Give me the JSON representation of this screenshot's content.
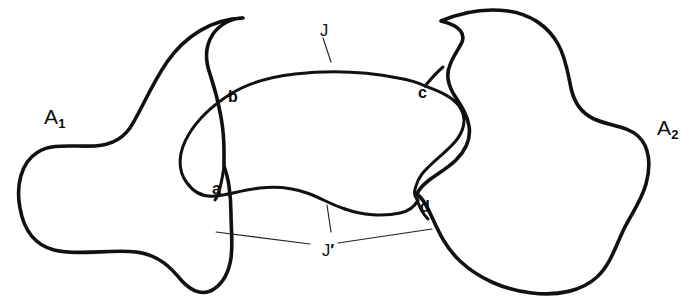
{
  "figure": {
    "background_color": "#ffffff",
    "stroke_color": "#111111",
    "width": 691,
    "height": 302
  },
  "regions": [
    {
      "id": "A1",
      "label": "A",
      "subscript": "1",
      "description": "left blob region",
      "label_x": 44,
      "label_y": 106
    },
    {
      "id": "A2",
      "label": "A",
      "subscript": "2",
      "description": "right blob region",
      "label_x": 657,
      "label_y": 117
    }
  ],
  "points": [
    {
      "id": "a",
      "label": "a",
      "x": 212,
      "y": 181,
      "description": "lower-left intersection point"
    },
    {
      "id": "b",
      "label": "b",
      "x": 228,
      "y": 89,
      "description": "upper-left intersection point"
    },
    {
      "id": "c",
      "label": "c",
      "x": 418,
      "y": 85,
      "description": "upper-right intersection point"
    },
    {
      "id": "d",
      "label": "d",
      "x": 420,
      "y": 199,
      "description": "lower-right intersection point"
    }
  ],
  "arcs": [
    {
      "id": "J",
      "label": "J",
      "prime": false,
      "description": "upper arc of the inner curve between b and c",
      "label_x": 320,
      "label_y": 22
    },
    {
      "id": "Jprime",
      "label": "J",
      "prime": true,
      "prime_glyph": "′",
      "description": "lower arc of the inner curve between a and d",
      "label_x": 322,
      "label_y": 242
    }
  ],
  "paths": {
    "blob_left": "M 243,18 C 212,19 185,36 167,62 C 152,84 143,106 133,123 C 125,138 111,145 95,146 C 72,147 52,143 38,152 C 20,163 16,187 20,208 C 24,231 35,245 54,250 C 78,256 110,249 136,252 C 160,255 172,269 182,281 C 192,292 204,296 214,289 C 223,283 229,271 231,258 C 233,243 231,228 231,214 C 231,203 230,193 229,186 C 228,178 226,172 224,166 L 224,152 C 224,140 223,128 221,117 C 218,100 214,86 210,74 C 205,60 205,46 213,34 C 220,24 232,18 243,18 Z",
    "blob_right": "M 441,21 C 462,12 486,8 508,11 C 530,14 548,26 558,44 C 566,58 568,74 571,88 C 574,102 581,113 594,119 C 610,126 627,126 638,136 C 650,147 651,166 646,184 C 641,202 630,216 623,231 C 615,248 610,265 597,277 C 582,291 558,296 532,293 C 504,290 478,278 460,261 C 444,246 437,228 430,213 C 426,204 422,198 417,194 C 419,189 423,185 428,181 C 437,174 448,168 456,160 C 466,150 471,138 469,126 C 467,113 459,103 453,93 C 448,84 446,74 450,65 C 453,56 459,49 462,42 C 465,34 461,26 441,21 Z",
    "oval_top": "M 229,95 C 246,84 268,77 295,74 C 330,70 368,72 398,78 C 410,80 419,83 425,86 C 430,80 436,73 443,67",
    "oval_top_right_tail": "M 425,86 C 438,91 452,96 459,106 C 468,118 464,132 454,143 C 444,154 431,163 422,174 C 419,178 417,182 416,186 C 414,191 414,196 417,199",
    "oval_left": "M 229,95 C 212,106 198,119 189,134 C 178,152 177,170 187,183 C 195,194 206,197 215,196",
    "oval_bottom_left": "M 215,196 C 227,195 243,190 260,188 C 277,186 293,188 307,193 C 321,198 332,205 345,209",
    "oval_bottom_right": "M 345,209 C 362,215 383,217 400,213 C 409,211 415,206 418,200",
    "blob_left_notch": "M 224,166 C 223,175 221,184 219,192 C 217,197 216,199 215,200",
    "blob_right_entry": "M 417,199 C 419,207 423,214 428,219",
    "leader_J": "M 323,38 L 331,62",
    "leader_Jp_left": "M 216,232 L 310,244",
    "leader_Jp_right": "M 338,243 L 432,229",
    "leader_Jp_tick": "M 327,205 L 331,232"
  }
}
